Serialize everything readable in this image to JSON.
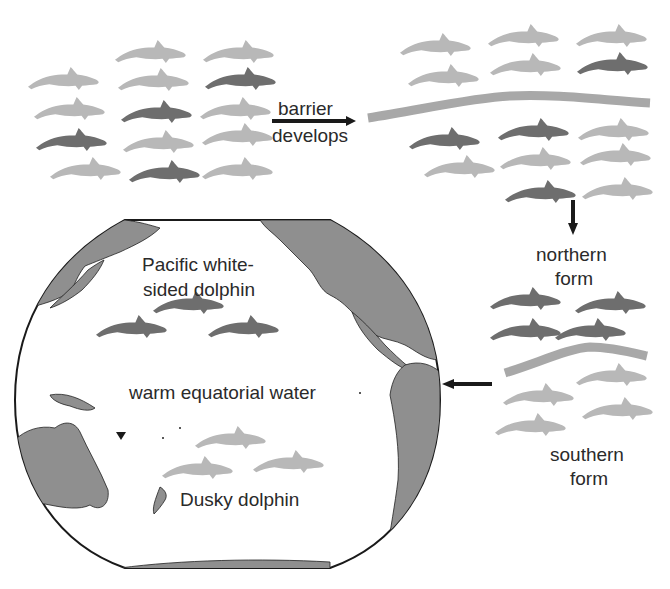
{
  "diagram": {
    "type": "allopatric-speciation-illustration",
    "colors": {
      "dolphin_light": "#b8b8b8",
      "dolphin_dark": "#6e6e6e",
      "barrier": "#a8a8a8",
      "land": "#8f8f8f",
      "ocean": "#ffffff",
      "arrow": "#1a1a1a",
      "text": "#2a2a2a"
    },
    "steps": [
      {
        "id": "original-population",
        "label": ""
      },
      {
        "id": "barrier-develops",
        "label_line1": "barrier",
        "label_line2": "develops"
      },
      {
        "id": "northern-form",
        "label_line1": "northern",
        "label_line2": "form"
      },
      {
        "id": "southern-form",
        "label_line1": "southern",
        "label_line2": "form"
      }
    ],
    "map": {
      "ocean_label": "warm equatorial water",
      "northern_species_line1": "Pacific white-",
      "northern_species_line2": "sided dolphin",
      "southern_species": "Dusky dolphin"
    },
    "dolphins": {
      "group1": [
        {
          "x": 28,
          "y": 67,
          "shade": "light"
        },
        {
          "x": 115,
          "y": 40,
          "shade": "light"
        },
        {
          "x": 203,
          "y": 40,
          "shade": "light"
        },
        {
          "x": 118,
          "y": 68,
          "shade": "light"
        },
        {
          "x": 205,
          "y": 67,
          "shade": "dark"
        },
        {
          "x": 34,
          "y": 97,
          "shade": "light"
        },
        {
          "x": 121,
          "y": 100,
          "shade": "dark"
        },
        {
          "x": 200,
          "y": 97,
          "shade": "light"
        },
        {
          "x": 36,
          "y": 128,
          "shade": "dark"
        },
        {
          "x": 123,
          "y": 130,
          "shade": "light"
        },
        {
          "x": 202,
          "y": 123,
          "shade": "light"
        },
        {
          "x": 50,
          "y": 157,
          "shade": "light"
        },
        {
          "x": 129,
          "y": 160,
          "shade": "dark"
        },
        {
          "x": 202,
          "y": 157,
          "shade": "light"
        }
      ],
      "group2": [
        {
          "x": 400,
          "y": 33,
          "shade": "light"
        },
        {
          "x": 488,
          "y": 24,
          "shade": "light"
        },
        {
          "x": 576,
          "y": 24,
          "shade": "light"
        },
        {
          "x": 408,
          "y": 64,
          "shade": "light"
        },
        {
          "x": 490,
          "y": 53,
          "shade": "light"
        },
        {
          "x": 577,
          "y": 52,
          "shade": "dark"
        },
        {
          "x": 409,
          "y": 127,
          "shade": "dark"
        },
        {
          "x": 498,
          "y": 118,
          "shade": "dark"
        },
        {
          "x": 578,
          "y": 118,
          "shade": "light"
        },
        {
          "x": 424,
          "y": 155,
          "shade": "light"
        },
        {
          "x": 500,
          "y": 147,
          "shade": "light"
        },
        {
          "x": 580,
          "y": 143,
          "shade": "light"
        },
        {
          "x": 505,
          "y": 180,
          "shade": "dark"
        },
        {
          "x": 582,
          "y": 177,
          "shade": "light"
        }
      ],
      "group3": [
        {
          "x": 490,
          "y": 287,
          "shade": "dark"
        },
        {
          "x": 575,
          "y": 291,
          "shade": "dark"
        },
        {
          "x": 490,
          "y": 318,
          "shade": "dark"
        },
        {
          "x": 555,
          "y": 318,
          "shade": "dark"
        },
        {
          "x": 576,
          "y": 363,
          "shade": "light"
        },
        {
          "x": 503,
          "y": 383,
          "shade": "light"
        },
        {
          "x": 582,
          "y": 397,
          "shade": "light"
        },
        {
          "x": 495,
          "y": 413,
          "shade": "light"
        }
      ],
      "map_north": [
        {
          "x": 153,
          "y": 291,
          "shade": "dark"
        },
        {
          "x": 96,
          "y": 315,
          "shade": "dark"
        },
        {
          "x": 208,
          "y": 315,
          "shade": "dark"
        }
      ],
      "map_south": [
        {
          "x": 195,
          "y": 426,
          "shade": "light"
        },
        {
          "x": 162,
          "y": 456,
          "shade": "light"
        },
        {
          "x": 253,
          "y": 450,
          "shade": "light"
        }
      ]
    }
  }
}
